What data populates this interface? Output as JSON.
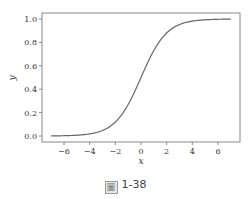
{
  "chart_data": {
    "type": "line",
    "title": "",
    "xlabel": "x",
    "ylabel": "y",
    "xlim": [
      -7.5,
      7.8
    ],
    "ylim": [
      -0.05,
      1.05
    ],
    "xticks": [
      -6,
      -4,
      -2,
      0,
      2,
      4,
      6
    ],
    "xtick_labels": [
      "−6",
      "−4",
      "−2",
      "0",
      "2",
      "4",
      "6"
    ],
    "yticks": [
      0.0,
      0.2,
      0.4,
      0.6,
      0.8,
      1.0
    ],
    "ytick_labels": [
      "0.0",
      "0.2",
      "0.4",
      "0.6",
      "0.8",
      "1.0"
    ],
    "grid": false,
    "legend": null,
    "series": [
      {
        "name": "sigmoid",
        "function": "1/(1+exp(-x))",
        "x": [
          -7,
          -6,
          -5,
          -4,
          -3,
          -2,
          -1,
          0,
          1,
          2,
          3,
          4,
          5,
          6,
          7
        ],
        "values": [
          0.001,
          0.002,
          0.007,
          0.018,
          0.047,
          0.119,
          0.269,
          0.5,
          0.731,
          0.881,
          0.953,
          0.982,
          0.993,
          0.998,
          0.999
        ],
        "color": "#666666"
      }
    ]
  },
  "caption": {
    "glyph": "圖",
    "text": "1-38"
  }
}
